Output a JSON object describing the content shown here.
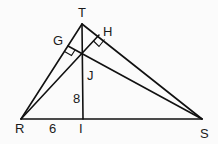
{
  "diagram": {
    "type": "geometry",
    "shape": "triangle",
    "points": {
      "T": {
        "label": "T",
        "x": 82,
        "y": 24
      },
      "R": {
        "label": "R",
        "x": 21,
        "y": 119
      },
      "S": {
        "label": "S",
        "x": 202,
        "y": 119
      },
      "I": {
        "label": "I",
        "x": 83,
        "y": 119
      },
      "J": {
        "label": "J",
        "x": 83,
        "y": 56
      },
      "G": {
        "label": "G",
        "x": 68,
        "y": 46
      },
      "H": {
        "label": "H",
        "x": 99,
        "y": 35
      }
    },
    "segments": [
      "TR",
      "TS",
      "RS",
      "TI",
      "RH",
      "SG"
    ],
    "right_angles": [
      "G",
      "H"
    ],
    "measures": {
      "JI": "8",
      "RI": "6"
    }
  }
}
